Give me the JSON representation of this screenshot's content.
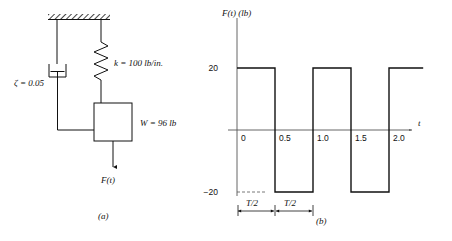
{
  "figure": {
    "panel_a": {
      "caption": "(a)",
      "damping_label": "ζ = 0.05",
      "spring_label": "k = 100 lb/in.",
      "mass_label": "W = 96 lb",
      "force_label": "F(t)",
      "icons": {
        "ceiling": "hatched-ceiling",
        "damper": "dashpot-icon",
        "spring": "coil-spring-icon",
        "mass": "mass-block-icon",
        "force_arrow": "down-arrow-icon"
      }
    },
    "panel_b": {
      "caption": "(b)",
      "y_axis_label": "F(t) (lb)",
      "x_axis_label": "t",
      "y_ticks": [
        "20",
        "−20"
      ],
      "x_ticks": [
        "0",
        "0.5",
        "1.0",
        "1.5",
        "2.0"
      ],
      "half_period_labels": [
        "T/2",
        "T/2"
      ]
    }
  },
  "chart_data": {
    "type": "line",
    "title": "",
    "xlabel": "t",
    "ylabel": "F(t) (lb)",
    "xlim": [
      0,
      2.45
    ],
    "ylim": [
      -26,
      26
    ],
    "grid": false,
    "legend": null,
    "waveform": "square",
    "amplitude": 20,
    "period": 1.0,
    "half_period": 0.5,
    "x": [
      0,
      0.5,
      0.5,
      1.0,
      1.0,
      1.5,
      1.5,
      2.0,
      2.0,
      2.45
    ],
    "y": [
      20,
      20,
      -20,
      -20,
      20,
      20,
      -20,
      -20,
      20,
      20
    ],
    "xticks": [
      0,
      0.5,
      1.0,
      1.5,
      2.0
    ],
    "xticklabels": [
      "0",
      "0.5",
      "1.0",
      "1.5",
      "2.0"
    ],
    "yticks": [
      20,
      -20
    ],
    "yticklabels": [
      "20",
      "−20"
    ],
    "annotations": [
      "T/2",
      "T/2"
    ]
  },
  "colors": {
    "ink": "#111111",
    "axis": "#555555",
    "background": "#ffffff"
  }
}
